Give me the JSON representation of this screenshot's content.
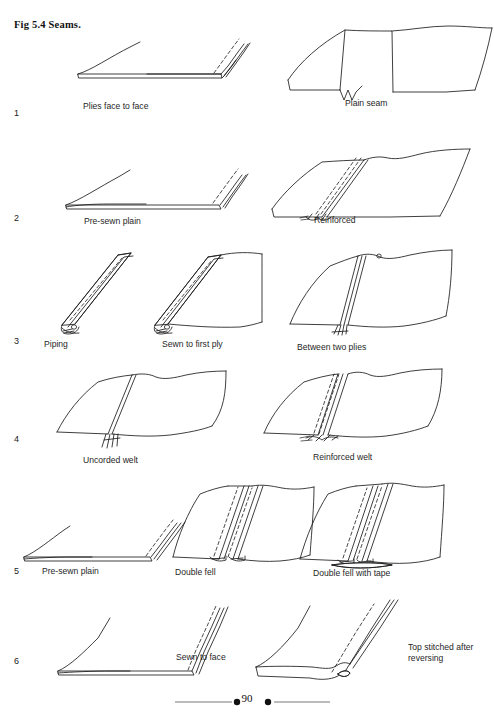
{
  "page": {
    "figure_title": "Fig 5.4 Seams.",
    "page_number": "90",
    "width": 494,
    "height": 718,
    "background_color": "#ffffff",
    "ink_color": "#1c1c1c"
  },
  "rows": [
    {
      "number": "1",
      "captions": [
        "Plies face to face",
        "Plain seam"
      ]
    },
    {
      "number": "2",
      "captions": [
        "Pre-sewn plain",
        "Reinforced"
      ]
    },
    {
      "number": "3",
      "captions": [
        "Piping",
        "Sewn to first ply",
        "Between two plies"
      ]
    },
    {
      "number": "4",
      "captions": [
        "Uncorded welt",
        "Reinforced welt"
      ]
    },
    {
      "number": "5",
      "captions": [
        "Pre-sewn plain",
        "Double fell",
        "Double fell with tape"
      ]
    },
    {
      "number": "6",
      "captions": [
        "Sewn to face",
        "Top stitched after\nreversing"
      ]
    }
  ],
  "captions": {
    "r1c1": "Plies face to face",
    "r1c2": "Plain seam",
    "r2c1": "Pre-sewn plain",
    "r2c2": "Reinforced",
    "r3c1": "Piping",
    "r3c2": "Sewn to first ply",
    "r3c3": "Between two plies",
    "r4c1": "Uncorded welt",
    "r4c2": "Reinforced welt",
    "r5c1": "Pre-sewn plain",
    "r5c2": "Double fell",
    "r5c3": "Double fell with tape",
    "r6c1": "Sewn to face",
    "r6c2": "Top stitched after\nreversing"
  },
  "row_numbers": {
    "n1": "1",
    "n2": "2",
    "n3": "3",
    "n4": "4",
    "n5": "5",
    "n6": "6"
  }
}
